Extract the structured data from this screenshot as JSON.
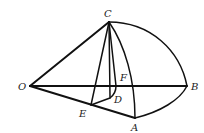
{
  "diagram": {
    "type": "solid-geometry-figure",
    "points": {
      "O": {
        "label": "O",
        "x": 30,
        "y": 86
      },
      "B": {
        "label": "B",
        "x": 187,
        "y": 86
      },
      "C": {
        "label": "C",
        "x": 109,
        "y": 22
      },
      "A": {
        "label": "A",
        "x": 135,
        "y": 118
      },
      "E": {
        "label": "E",
        "x": 91,
        "y": 105
      },
      "D": {
        "label": "D",
        "x": 111,
        "y": 97
      },
      "F": {
        "label": "F",
        "x": 117,
        "y": 86
      }
    },
    "segments": [
      "OC",
      "OB",
      "OA",
      "EA",
      "CE",
      "CD",
      "CF",
      "ED",
      "DF",
      "CA(arc)",
      "CB(arc)",
      "AB(arc)"
    ],
    "labels": {
      "O": "O",
      "B": "B",
      "C": "C",
      "A": "A",
      "E": "E",
      "D": "D",
      "F": "F"
    }
  }
}
